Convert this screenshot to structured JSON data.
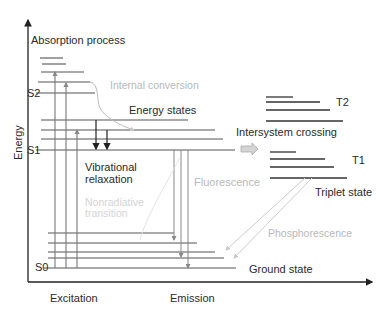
{
  "diagram": {
    "type": "Jablonski diagram",
    "axes": {
      "y_label": "Energy",
      "x_labels": [
        "Excitation",
        "Emission"
      ]
    },
    "titles": {
      "absorption": "Absorption process"
    },
    "states": {
      "s2": "S2",
      "s1": "S1",
      "s0": "S0",
      "t2": "T2",
      "t1": "T1"
    },
    "labels": {
      "internal_conversion": "Internal conversion",
      "energy_states": "Energy states",
      "intersystem_crossing": "Intersystem crossing",
      "vibrational_relaxation_1": "Vibrational",
      "vibrational_relaxation_2": "relaxation",
      "nonradiative_1": "Nonradiative",
      "nonradiative_2": "transition",
      "fluorescence": "Fluorescence",
      "triplet_state": "Triplet state",
      "phosphorescence": "Phosphorescence",
      "ground_state": "Ground state"
    },
    "colors": {
      "line": "#555555",
      "axis": "#222222",
      "light_text": "#b8b8b8",
      "faint_text": "#d4d4d4",
      "arrow_fill": "#cfcfcf"
    }
  }
}
